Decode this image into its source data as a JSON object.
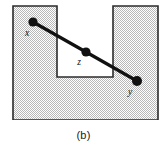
{
  "figure": {
    "caption": "(b)",
    "canvas": {
      "width": 167,
      "height": 148
    },
    "region": {
      "name": "u-shaped-polygon",
      "description": "U-shaped shaded polygon with rectangular notch cut from the top edge",
      "fill_color": "#d9d9d9",
      "pattern": "stipple-dither",
      "outline_color": "#2b2b2b",
      "outline_width": 1.6,
      "outer_bounds": {
        "left": 13,
        "top": 6,
        "right": 158,
        "bottom": 120
      },
      "notch": {
        "left": 57,
        "top": 6,
        "right": 113,
        "bottom": 77
      },
      "path_points": [
        {
          "x": 13,
          "y": 6
        },
        {
          "x": 57,
          "y": 6
        },
        {
          "x": 57,
          "y": 77
        },
        {
          "x": 113,
          "y": 77
        },
        {
          "x": 113,
          "y": 6
        },
        {
          "x": 158,
          "y": 6
        },
        {
          "x": 158,
          "y": 120
        },
        {
          "x": 13,
          "y": 120
        }
      ]
    },
    "segments": [
      {
        "name": "segment-x-z",
        "from": "x",
        "to": "z",
        "color": "#111111",
        "width": 3.2
      },
      {
        "name": "segment-z-y",
        "from": "z",
        "to": "y",
        "color": "#111111",
        "width": 3.2
      }
    ],
    "points": [
      {
        "id": "x",
        "label": "x",
        "cx": 33,
        "cy": 22,
        "r": 4.6,
        "color": "#111111",
        "label_x": 27,
        "label_y": 36
      },
      {
        "id": "z",
        "label": "z",
        "cx": 86,
        "cy": 52,
        "r": 4.6,
        "color": "#111111",
        "label_x": 79,
        "label_y": 65
      },
      {
        "id": "y",
        "label": "y",
        "cx": 137,
        "cy": 81,
        "r": 5.0,
        "color": "#111111",
        "label_x": 130,
        "label_y": 95
      }
    ]
  }
}
